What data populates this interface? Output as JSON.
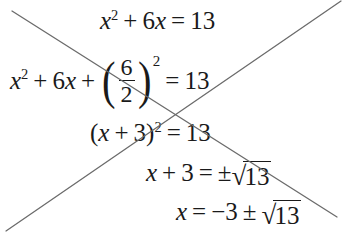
{
  "page": {
    "background_color": "#ffffff",
    "ink_color": "#1a1a1a",
    "pencil_color": "#6b6b6b",
    "width": 344,
    "height": 237
  },
  "equations": {
    "line1": {
      "text": "x^2 + 6x = 13",
      "x_var": "x",
      "exp2": "2",
      "plus": "+",
      "term_6x_coef": "6",
      "term_6x_var": "x",
      "equals": "=",
      "rhs": "13"
    },
    "line2": {
      "text": "x^2 + 6x + (6/2)^2 = 13",
      "x_var": "x",
      "exp2": "2",
      "plus1": "+",
      "term_6x_coef": "6",
      "term_6x_var": "x",
      "plus2": "+",
      "paren_open": "(",
      "frac_numerator": "6",
      "frac_denominator": "2",
      "paren_close": ")",
      "paren_exponent": "2",
      "equals": "=",
      "rhs": "13"
    },
    "line3": {
      "text": "(x + 3)^2 = 13",
      "paren_open": "(",
      "x_var": "x",
      "plus": "+",
      "three": "3",
      "paren_close": ")",
      "exponent": "2",
      "equals": "=",
      "rhs": "13"
    },
    "line4": {
      "text": "x + 3 = ± sqrt(13)",
      "x_var": "x",
      "plus": "+",
      "three": "3",
      "equals": "=",
      "plusminus": "±",
      "radical_sign": "√",
      "radicand": "13"
    },
    "line5": {
      "text": "x = -3 ± sqrt(13)",
      "x_var": "x",
      "equals": "=",
      "minus": "−",
      "three": "3",
      "plusminus": "±",
      "radical_sign": "√",
      "radicand": "13"
    }
  },
  "annotations": {
    "strike_through_descending": "diagonal line from top-left to bottom-right",
    "strike_through_ascending": "diagonal line from bottom-left to top-right"
  }
}
